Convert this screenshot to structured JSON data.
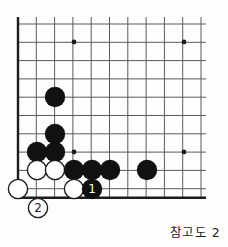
{
  "diagram": {
    "kind": "go-board-diagram",
    "caption": "참고도 2",
    "board": {
      "columns": 11,
      "rows": 10,
      "origin_x": 18,
      "origin_y": 24,
      "spacing": 18.3,
      "edge_left": true,
      "edge_top": false,
      "edge_bottom": true,
      "edge_right": false,
      "line_color": "#5a5a5a",
      "edge_color": "#1d1d1d",
      "background_color": "#fdfdfc"
    },
    "star_points": [
      {
        "name": "star-top-left",
        "x": 74,
        "y": 42
      },
      {
        "name": "star-top-right",
        "x": 184,
        "y": 42
      },
      {
        "name": "star-bottom-left",
        "x": 74,
        "y": 152
      },
      {
        "name": "star-bottom-right",
        "x": 184,
        "y": 152
      }
    ],
    "stone_radius": 10.2,
    "colors": {
      "black_stone": "#111111",
      "white_stone": "#ffffff",
      "white_stone_border": "#1d1d1d",
      "black_label_text": "#ffffff",
      "white_label_text": "#1d1d1d"
    },
    "stones": [
      {
        "id": "b1",
        "color": "black",
        "x": 55,
        "y": 97,
        "label": ""
      },
      {
        "id": "b2",
        "color": "black",
        "x": 55,
        "y": 134,
        "label": ""
      },
      {
        "id": "b3",
        "color": "black",
        "x": 37,
        "y": 152,
        "label": ""
      },
      {
        "id": "b4",
        "color": "black",
        "x": 55,
        "y": 152,
        "label": ""
      },
      {
        "id": "w1",
        "color": "white",
        "x": 37,
        "y": 170,
        "label": ""
      },
      {
        "id": "w2",
        "color": "white",
        "x": 55,
        "y": 170,
        "label": ""
      },
      {
        "id": "b5",
        "color": "black",
        "x": 74,
        "y": 170,
        "label": ""
      },
      {
        "id": "b6",
        "color": "black",
        "x": 92,
        "y": 170,
        "label": ""
      },
      {
        "id": "b7",
        "color": "black",
        "x": 110,
        "y": 170,
        "label": ""
      },
      {
        "id": "b8",
        "color": "black",
        "x": 147,
        "y": 170,
        "label": ""
      },
      {
        "id": "w3",
        "color": "white",
        "x": 18,
        "y": 189,
        "label": ""
      },
      {
        "id": "w4",
        "color": "white",
        "x": 74,
        "y": 189,
        "label": ""
      },
      {
        "id": "move1",
        "color": "black",
        "x": 92,
        "y": 189,
        "label": "1"
      },
      {
        "id": "move2",
        "color": "white",
        "x": 38,
        "y": 208,
        "label": "2"
      }
    ]
  }
}
